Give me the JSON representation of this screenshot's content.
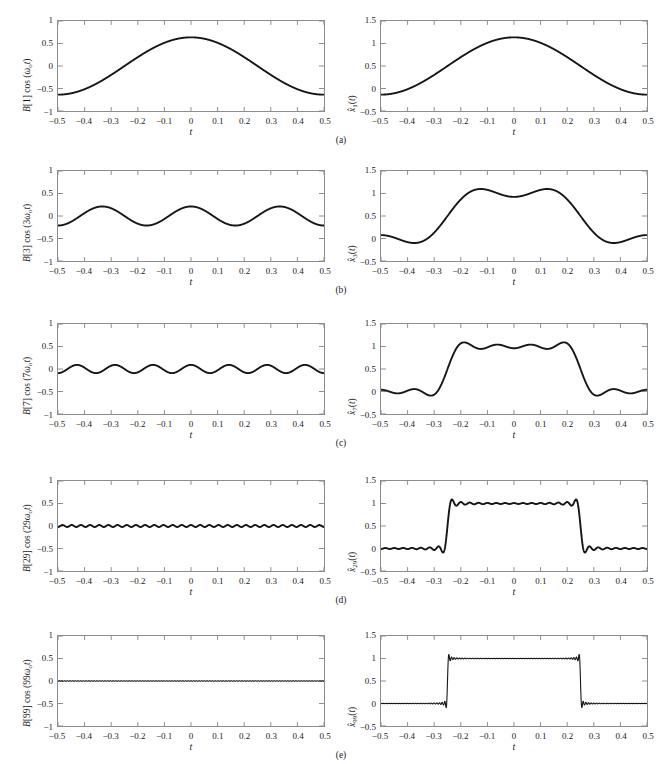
{
  "figure": {
    "type": "multi-panel-plot",
    "rows": 5,
    "columns": 2,
    "subcaptions": [
      "(a)",
      "(b)",
      "(c)",
      "(d)",
      "(e)"
    ],
    "xlabel": "t",
    "xticks": [
      "−0.5",
      "−0.4",
      "−0.3",
      "−0.2",
      "−0.1",
      "0",
      "0.1",
      "0.2",
      "0.3",
      "0.4",
      "0.5"
    ],
    "xtick_values": [
      -0.5,
      -0.4,
      -0.3,
      -0.2,
      -0.1,
      0,
      0.1,
      0.2,
      0.3,
      0.4,
      0.5
    ],
    "left_yticks": [
      "1",
      "0.5",
      "0",
      "−0.5",
      "−1"
    ],
    "left_ytick_values": [
      1,
      0.5,
      0,
      -0.5,
      -1
    ],
    "right_yticks": [
      "1.5",
      "1",
      "0.5",
      "0",
      "−0.5"
    ],
    "right_ytick_values": [
      1.5,
      1,
      0.5,
      0,
      -0.5
    ],
    "line_color": "#161616",
    "axis_color": "#8c8c8c"
  },
  "panels": {
    "left": [
      {
        "ylabel_pre": "B[1] cos (",
        "ylabel_sub": "ω",
        "ylabel_sub2": "o",
        "ylabel_post": "t)",
        "ylabel_plain": "B[1] cos (ωₒt)",
        "harmonic": 1,
        "amplitude": 0.637
      },
      {
        "ylabel_pre": "B[3] cos (3",
        "ylabel_sub": "ω",
        "ylabel_sub2": "o",
        "ylabel_post": "t)",
        "ylabel_plain": "B[3] cos (3ωₒt)",
        "harmonic": 3,
        "amplitude": 0.212
      },
      {
        "ylabel_pre": "B[7] cos (7",
        "ylabel_sub": "ω",
        "ylabel_sub2": "o",
        "ylabel_post": "t)",
        "ylabel_plain": "B[7] cos (7ωₒt)",
        "harmonic": 7,
        "amplitude": 0.091
      },
      {
        "ylabel_pre": "B[29] cos (29",
        "ylabel_sub": "ω",
        "ylabel_sub2": "o",
        "ylabel_post": "t)",
        "ylabel_plain": "B[29] cos (29ωₒt)",
        "harmonic": 29,
        "amplitude": 0.022
      },
      {
        "ylabel_pre": "B[99] cos (99",
        "ylabel_sub": "ω",
        "ylabel_sub2": "o",
        "ylabel_post": "t)",
        "ylabel_plain": "B[99] cos (99ωₒt)",
        "harmonic": 99,
        "amplitude": 0.0064
      }
    ],
    "right": [
      {
        "ylabel_plain": "x̂1(t)",
        "order": 1,
        "peak": 1.12,
        "trough": -0.16
      },
      {
        "ylabel_plain": "x̂3(t)",
        "order": 3,
        "peak": 1.1,
        "trough": -0.13
      },
      {
        "ylabel_plain": "x̂7(t)",
        "order": 7,
        "peak": 1.09,
        "trough": -0.12
      },
      {
        "ylabel_plain": "x̂29(t)",
        "order": 29,
        "peak": 1.08,
        "trough": -0.09
      },
      {
        "ylabel_plain": "x̂99(t)",
        "order": 99,
        "peak": 1.08,
        "trough": -0.08
      }
    ]
  },
  "chart_data": {
    "type": "line",
    "title": "",
    "xlabel": "t",
    "ylabel": "",
    "xlim": [
      -0.5,
      0.5
    ],
    "grid": false,
    "legend": "none",
    "charts": [
      {
        "panel": "a-left",
        "ylabel": "B[1] cos (ωₒt)",
        "ylim": [
          -1,
          1
        ],
        "series": [
          {
            "name": "B[1]cos(ωₒt)",
            "harmonic": 1,
            "amplitude": 0.637,
            "form": "A*cos(2*pi*n*t)",
            "n": 1
          }
        ]
      },
      {
        "panel": "a-right",
        "ylabel": "x̂1(t)",
        "ylim": [
          -0.5,
          1.5
        ],
        "series": [
          {
            "name": "x̂1(t)",
            "order": 1,
            "form": "0.5 + 0.637*cos(2*pi*t)",
            "max": 1.12,
            "min": -0.16
          }
        ]
      },
      {
        "panel": "b-left",
        "ylabel": "B[3] cos (3ωₒt)",
        "ylim": [
          -1,
          1
        ],
        "series": [
          {
            "name": "B[3]cos(3ωₒt)",
            "harmonic": 3,
            "amplitude": 0.212,
            "form": "A*cos(2*pi*n*t)",
            "n": 3
          }
        ]
      },
      {
        "panel": "b-right",
        "ylabel": "x̂3(t)",
        "ylim": [
          -0.5,
          1.5
        ],
        "series": [
          {
            "name": "x̂3(t)",
            "order": 3,
            "form": "0.5 + sum_{n=1,3} B[n]cos(2*pi*n*t)",
            "max": 1.1,
            "min": -0.13
          }
        ]
      },
      {
        "panel": "c-left",
        "ylabel": "B[7] cos (7ωₒt)",
        "ylim": [
          -1,
          1
        ],
        "series": [
          {
            "name": "B[7]cos(7ωₒt)",
            "harmonic": 7,
            "amplitude": 0.091,
            "form": "A*cos(2*pi*n*t)",
            "n": 7
          }
        ]
      },
      {
        "panel": "c-right",
        "ylabel": "x̂7(t)",
        "ylim": [
          -0.5,
          1.5
        ],
        "series": [
          {
            "name": "x̂7(t)",
            "order": 7,
            "form": "0.5 + sum_{n odd<=7} B[n]cos(2*pi*n*t)",
            "max": 1.09,
            "min": -0.12
          }
        ]
      },
      {
        "panel": "d-left",
        "ylabel": "B[29] cos (29ωₒt)",
        "ylim": [
          -1,
          1
        ],
        "series": [
          {
            "name": "B[29]cos(29ωₒt)",
            "harmonic": 29,
            "amplitude": 0.022,
            "form": "A*cos(2*pi*n*t)",
            "n": 29
          }
        ]
      },
      {
        "panel": "d-right",
        "ylabel": "x̂29(t)",
        "ylim": [
          -0.5,
          1.5
        ],
        "series": [
          {
            "name": "x̂29(t)",
            "order": 29,
            "form": "0.5 + sum_{n odd<=29} B[n]cos(2*pi*n*t)",
            "max": 1.08,
            "min": -0.09
          }
        ]
      },
      {
        "panel": "e-left",
        "ylabel": "B[99] cos (99ωₒt)",
        "ylim": [
          -1,
          1
        ],
        "series": [
          {
            "name": "B[99]cos(99ωₒt)",
            "harmonic": 99,
            "amplitude": 0.0064,
            "form": "A*cos(2*pi*n*t)",
            "n": 99
          }
        ]
      },
      {
        "panel": "e-right",
        "ylabel": "x̂99(t)",
        "ylim": [
          -0.5,
          1.5
        ],
        "series": [
          {
            "name": "x̂99(t)",
            "order": 99,
            "form": "0.5 + sum_{n odd<=99} B[n]cos(2*pi*n*t)",
            "max": 1.08,
            "min": -0.08
          }
        ]
      }
    ]
  }
}
